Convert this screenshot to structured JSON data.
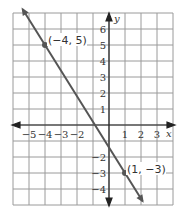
{
  "chart_data": {
    "type": "line",
    "title": "",
    "xlabel": "x",
    "ylabel": "y",
    "xlim": [
      -6,
      4
    ],
    "ylim": [
      -5,
      7
    ],
    "grid": true,
    "x_ticks": [
      "-5",
      "-4",
      "-3",
      "-2",
      "1",
      "2",
      "3"
    ],
    "y_ticks": [
      "6",
      "5",
      "4",
      "3",
      "2",
      "1",
      "-2",
      "-3",
      "-4"
    ],
    "series": [
      {
        "name": "line",
        "color": "#555555",
        "points": [
          {
            "x": -4,
            "y": 5,
            "label": "(−4, 5)"
          },
          {
            "x": 1,
            "y": -3,
            "label": "(1, −3)"
          }
        ],
        "slope": -1.6,
        "intercept": -1.4
      }
    ]
  },
  "labels": {
    "x_axis": "x",
    "y_axis": "y",
    "point_a": "(−4, 5)",
    "point_b": "(1, −3)"
  }
}
